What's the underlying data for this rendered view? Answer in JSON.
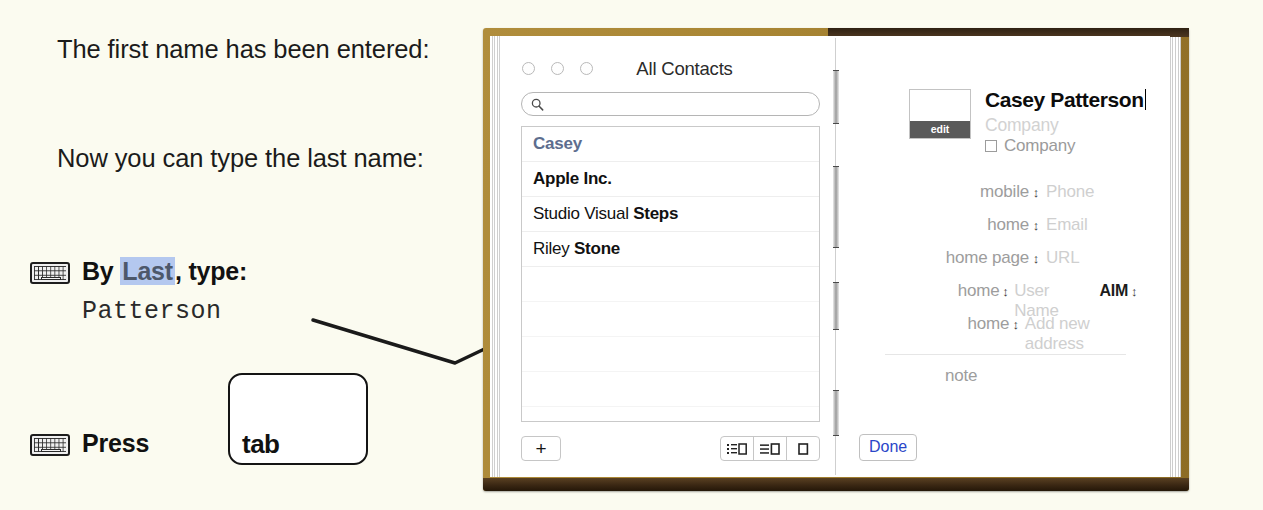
{
  "instructions": {
    "paragraph_1": "The first name has been entered:",
    "paragraph_2": "Now you can type the last name:",
    "step_type": {
      "icon": "keyboard-icon",
      "prefix": "By ",
      "highlight": "Last",
      "suffix": ", type:",
      "typed_value": "Patterson"
    },
    "step_press": {
      "icon": "keyboard-icon",
      "label": "Press",
      "key_cap": "tab"
    }
  },
  "contacts_window": {
    "title": "All Contacts",
    "search": {
      "value": "",
      "placeholder": ""
    },
    "list": [
      {
        "first": "Casey",
        "last": "",
        "state": "editing"
      },
      {
        "first": "",
        "last": "Apple Inc.",
        "state": "normal"
      },
      {
        "first": "Studio Visual ",
        "last": "Steps",
        "state": "normal"
      },
      {
        "first": "Riley ",
        "last": "Stone",
        "state": "normal"
      }
    ],
    "toolbar": {
      "add_label": "+",
      "view_modes": [
        "list-detail-view",
        "compact-list-view",
        "card-only-view"
      ]
    }
  },
  "contact_card": {
    "photo": {
      "edit_label": "edit"
    },
    "name": "Casey Patterson",
    "company_placeholder": "Company",
    "company_checkbox_label": "Company",
    "fields": [
      {
        "label": "mobile",
        "stepper": "↕",
        "value": "Phone",
        "extra": ""
      },
      {
        "label": "home",
        "stepper": "↕",
        "value": "Email",
        "extra": ""
      },
      {
        "label": "home page",
        "stepper": "↕",
        "value": "URL",
        "extra": ""
      },
      {
        "label": "home",
        "stepper": "↕",
        "value": "User Name",
        "extra": "AIM"
      },
      {
        "label": "home",
        "stepper": "↕",
        "value": "Add new address",
        "extra": ""
      }
    ],
    "note_label": "note",
    "done_label": "Done"
  },
  "colors": {
    "page_background": "#fbfbf0",
    "book_cover": "#a98634",
    "book_edge": "#30200f",
    "selection_highlight": "#b4c8ef",
    "editing_contact": "#5d6d8e",
    "done_link": "#2a46c8",
    "placeholder_gray": "#cfcfcf"
  }
}
